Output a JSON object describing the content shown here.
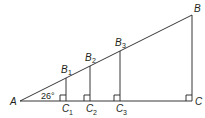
{
  "diagram": {
    "type": "similar-right-triangles",
    "angle_label": "26°",
    "points": {
      "A": {
        "label": "A",
        "x": 20,
        "y": 101
      },
      "B": {
        "label": "B",
        "x": 192,
        "y": 15
      },
      "C": {
        "label": "C",
        "x": 192,
        "y": 101
      },
      "B1": {
        "label": "B",
        "sub": "1",
        "x": 66,
        "y": 78
      },
      "B2": {
        "label": "B",
        "sub": "2",
        "x": 90,
        "y": 66
      },
      "B3": {
        "label": "B",
        "sub": "3",
        "x": 120,
        "y": 51
      },
      "C1": {
        "label": "C",
        "sub": "1",
        "x": 66,
        "y": 101
      },
      "C2": {
        "label": "C",
        "sub": "2",
        "x": 90,
        "y": 101
      },
      "C3": {
        "label": "C",
        "sub": "3",
        "x": 120,
        "y": 101
      }
    },
    "line_color": "#231f20"
  }
}
